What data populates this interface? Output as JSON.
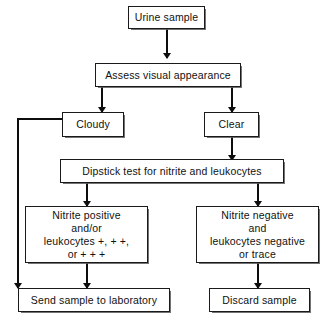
{
  "diagram": {
    "background_color": "#ffffff",
    "line_color": "#0d0d0d",
    "box_border_color": "#1a1a1a",
    "box_fill_color": "#ffffff"
  },
  "nodes": {
    "urine_sample": "Urine sample",
    "assess_visual_appearance": "Assess visual appearance",
    "cloudy": "Cloudy",
    "clear": "Clear",
    "dipstick_test": "Dipstick test for nitrite and leukocytes",
    "nitrite_positive": "Nitrite positive\nand/or\nleukocytes +, + +,\nor + + +",
    "nitrite_negative": "Nitrite negative\nand\nleukocytes negative\nor trace",
    "send_to_laboratory": "Send sample to laboratory",
    "discard_sample": "Discard sample"
  }
}
